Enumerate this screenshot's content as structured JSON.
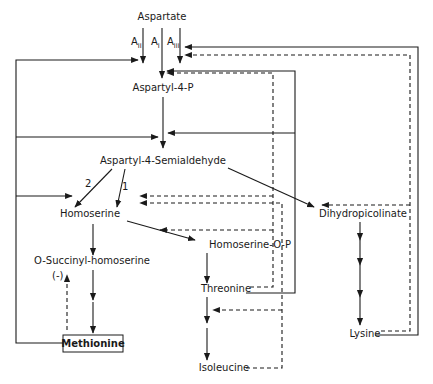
{
  "diagram": {
    "nodes": {
      "aspartate": "Aspartate",
      "aspartyl_4_p": "Aspartyl-4-P",
      "aspartyl_4_semialdehyde": "Aspartyl-4-Semialdehyde",
      "homoserine": "Homoserine",
      "homoserine_o_p": "Homoserine-O-P",
      "o_succinyl_homoserine": "O-Succinyl-homoserine",
      "methionine": "Methionine",
      "threonine": "Threonine",
      "isoleucine": "Isoleucine",
      "dihydropicolinate": "Dihydropicolinate",
      "lysine": "Lysine"
    },
    "enzyme_labels": {
      "a_ii": {
        "base": "A",
        "sub": "II"
      },
      "a_i": {
        "base": "A",
        "sub": "I"
      },
      "a_iii": {
        "base": "A",
        "sub": "III"
      },
      "route_2": "2",
      "route_1": "1",
      "negative": "(-)"
    },
    "legend": {
      "solid_line": "pathway / feedback (solid)",
      "dashed_line": "feedback inhibition (dashed)"
    }
  }
}
